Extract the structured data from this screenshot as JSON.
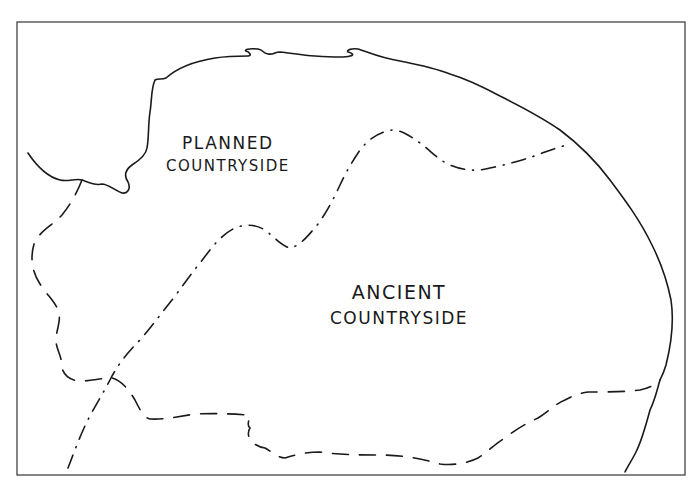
{
  "map": {
    "regions": [
      {
        "id": "planned",
        "line1": "PLANNED",
        "line2": "COUNTRYSIDE"
      },
      {
        "id": "ancient",
        "line1": "ANCIENT",
        "line2": "COUNTRYSIDE"
      }
    ],
    "line_styles": {
      "coastline": "solid",
      "ancient_countryside_boundary": "dashed",
      "planned_ancient_division": "dash-dot"
    },
    "colors": {
      "ink": "#1a1a1a",
      "frame": "#444444",
      "background": "#ffffff"
    }
  }
}
